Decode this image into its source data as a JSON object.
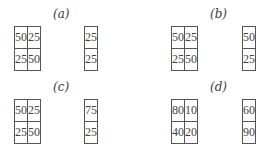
{
  "panels": [
    {
      "label": "(a)",
      "matrix": [
        [
          "50",
          "25"
        ],
        [
          "25",
          "50"
        ]
      ],
      "vector": [
        "25",
        "25"
      ]
    },
    {
      "label": "(b)",
      "matrix": [
        [
          "50",
          "25"
        ],
        [
          "25",
          "50"
        ]
      ],
      "vector": [
        "50",
        "25"
      ]
    },
    {
      "label": "(c)",
      "matrix": [
        [
          "50",
          "25"
        ],
        [
          "25",
          "50"
        ]
      ],
      "vector": [
        "75",
        "25"
      ]
    },
    {
      "label": "(d)",
      "matrix": [
        [
          "80",
          "10"
        ],
        [
          "40",
          "20"
        ]
      ],
      "vector": [
        "60",
        "90"
      ]
    }
  ]
}
